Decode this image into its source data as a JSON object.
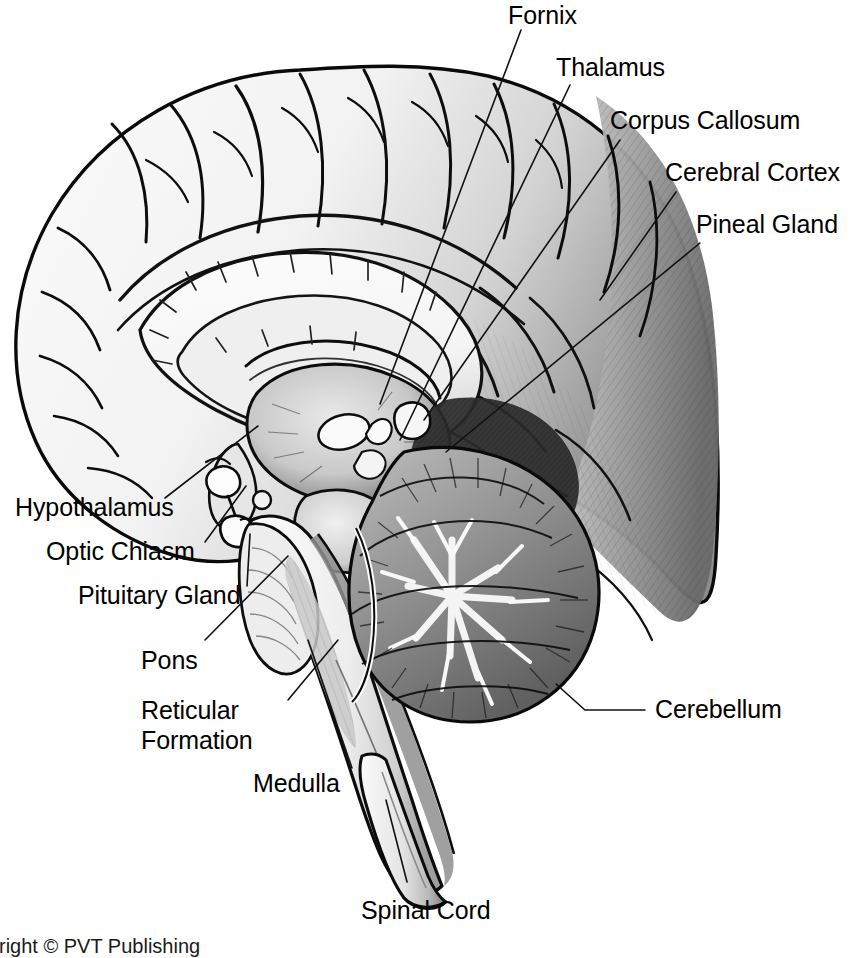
{
  "figure": {
    "kind": "anatomical-illustration",
    "style": "black-and-white pen-and-ink / stipple medical drawing",
    "orientation": "facing left, brainstem and spinal cord descending to lower right",
    "background_color": "#ffffff",
    "ink_color": "#000000"
  },
  "labels": {
    "fornix": "Fornix",
    "thalamus": "Thalamus",
    "corpus_callosum": "Corpus Callosum",
    "cerebral_cortex": "Cerebral Cortex",
    "pineal_gland": "Pineal Gland",
    "cerebellum": "Cerebellum",
    "hypothalamus": "Hypothalamus",
    "optic_chiasm": "Optic Chiasm",
    "pituitary_gland": "Pituitary Gland",
    "pons": "Pons",
    "reticular_formation_line1": "Reticular",
    "reticular_formation_line2": "Formation",
    "medulla": "Medulla",
    "spinal_cord": "Spinal Cord"
  },
  "credit": {
    "text": "yright © PVT Publishing",
    "note_visible": "clipped at left and bottom edge of frame"
  },
  "structures": [
    "cerebral cortex",
    "corpus callosum",
    "fornix",
    "thalamus",
    "hypothalamus",
    "optic chiasm",
    "pituitary gland",
    "pineal gland",
    "midbrain",
    "pons",
    "reticular formation",
    "medulla oblongata",
    "cerebellum",
    "spinal cord"
  ]
}
